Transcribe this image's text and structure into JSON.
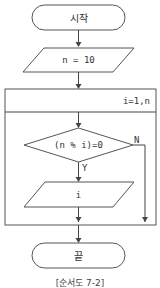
{
  "flowchart": {
    "start": {
      "label": "시작"
    },
    "input": {
      "label": "n = 10"
    },
    "loop": {
      "header": "i=1,n"
    },
    "decision": {
      "label": "(n % i)=0",
      "yes": "Y",
      "no": "N"
    },
    "output": {
      "label": "i"
    },
    "end": {
      "label": "끝"
    },
    "caption": "[순서도 7-2]"
  },
  "colors": {
    "stroke": "#555555",
    "background": "#ffffff",
    "text": "#333333"
  }
}
